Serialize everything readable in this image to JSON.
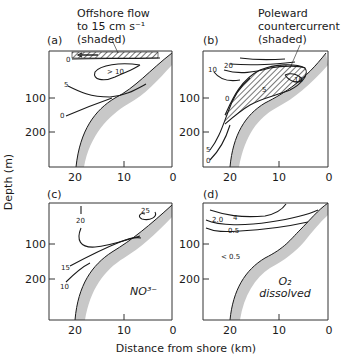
{
  "figure": {
    "y_axis_title": "Depth (m)",
    "x_axis_title": "Distance from shore (km)",
    "x_ticks": [
      "20",
      "10",
      "0"
    ],
    "y_ticks": [
      "100",
      "200"
    ],
    "colors": {
      "line": "#1a1a1a",
      "shelf": "#c8c8c8",
      "background": "#ffffff"
    }
  },
  "panels": [
    {
      "id": "a",
      "label": "(a)",
      "annotation": [
        "Offshore flow",
        "to 15 cm s⁻¹",
        "(shaded)"
      ],
      "contour_labels": [
        "0",
        "> 10",
        "5",
        "0"
      ]
    },
    {
      "id": "b",
      "label": "(b)",
      "annotation": [
        "Poleward",
        "countercurrent",
        "(shaded)"
      ],
      "contour_labels": [
        "10",
        "20",
        "10",
        "5",
        "0",
        "5",
        "0"
      ]
    },
    {
      "id": "c",
      "label": "(c)",
      "species": "NO³⁻",
      "contour_labels": [
        "20",
        "25",
        "15",
        "10"
      ]
    },
    {
      "id": "d",
      "label": "(d)",
      "species_line1": "O₂",
      "species_line2": "dissolved",
      "contour_labels": [
        "4",
        "2.0",
        "0.5",
        "< 0.5"
      ]
    }
  ]
}
